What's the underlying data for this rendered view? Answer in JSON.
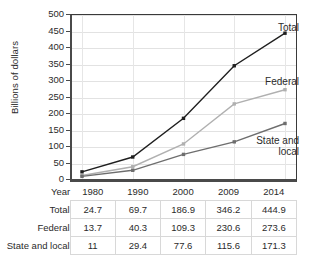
{
  "chart_data": {
    "type": "line",
    "title": "",
    "xlabel": "Year",
    "ylabel": "Billions of dollars",
    "categories": [
      "1980",
      "1990",
      "2000",
      "2009",
      "2014"
    ],
    "ylim": [
      0,
      500
    ],
    "yticks": [
      0,
      50,
      100,
      150,
      200,
      250,
      300,
      350,
      400,
      450,
      500
    ],
    "grid": true,
    "legend_position": "inline-right",
    "series": [
      {
        "name": "Total",
        "values": [
          24.7,
          69.7,
          186.9,
          346.2,
          444.9
        ],
        "color": "#1f1f1f"
      },
      {
        "name": "Federal",
        "values": [
          13.7,
          40.3,
          109.3,
          230.6,
          273.6
        ],
        "color": "#b0b0b0"
      },
      {
        "name": "State and local",
        "values": [
          11,
          29.4,
          77.6,
          115.6,
          171.3
        ],
        "color": "#6e6e6e"
      }
    ],
    "annotations": [
      {
        "text": "Total",
        "series": "Total"
      },
      {
        "text": "Federal",
        "series": "Federal"
      },
      {
        "text": "State and\nlocal",
        "series": "State and local"
      }
    ]
  },
  "table": {
    "year_label": "Year",
    "columns": [
      "1980",
      "1990",
      "2000",
      "2009",
      "2014"
    ],
    "rows": [
      {
        "label": "Total",
        "values": [
          "24.7",
          "69.7",
          "186.9",
          "346.2",
          "444.9"
        ]
      },
      {
        "label": "Federal",
        "values": [
          "13.7",
          "40.3",
          "109.3",
          "230.6",
          "273.6"
        ]
      },
      {
        "label": "State and local",
        "values": [
          "11",
          "29.4",
          "77.6",
          "115.6",
          "171.3"
        ]
      }
    ]
  },
  "axis": {
    "y_label": "Billions of dollars",
    "y_ticks": [
      "500",
      "450",
      "400",
      "350",
      "300",
      "250",
      "200",
      "150",
      "100",
      "50",
      "0"
    ]
  },
  "labels": {
    "total": "Total",
    "federal": "Federal",
    "state_and_local": "State and\nlocal"
  }
}
